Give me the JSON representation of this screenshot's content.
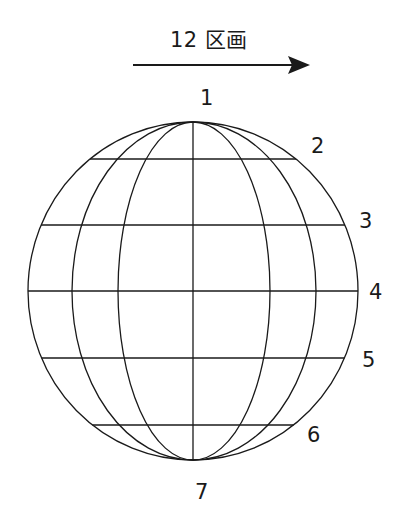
{
  "header": {
    "title": "12 区画",
    "arrow_direction": "right"
  },
  "globe": {
    "center": [
      193,
      291
    ],
    "rx": 165,
    "ry": 169,
    "meridian_offsets": [
      -121,
      -75,
      0,
      77,
      123
    ],
    "parallel_y": [
      159,
      225,
      291,
      358,
      425
    ],
    "stroke": "#1a1a1a"
  },
  "labels": [
    {
      "text": "1",
      "x": 200,
      "y": 88
    },
    {
      "text": "2",
      "x": 311,
      "y": 136
    },
    {
      "text": "3",
      "x": 359,
      "y": 211
    },
    {
      "text": "4",
      "x": 369,
      "y": 282
    },
    {
      "text": "5",
      "x": 362,
      "y": 350
    },
    {
      "text": "6",
      "x": 307,
      "y": 425
    },
    {
      "text": "7",
      "x": 195,
      "y": 482
    }
  ]
}
